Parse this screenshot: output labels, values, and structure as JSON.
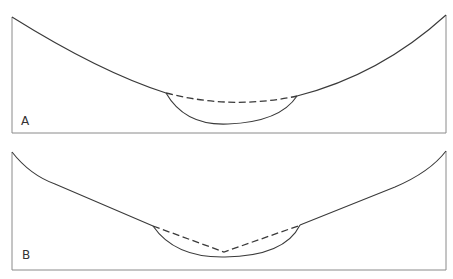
{
  "panels": [
    {
      "id": "A",
      "label": "A",
      "description": "Valley profile with rounded inner channel; dashed line shows former curved profile"
    },
    {
      "id": "B",
      "label": "B",
      "description": "Valley profile with rounded inner channel; dashed line shows former V-shaped profile"
    }
  ],
  "colors": {
    "line": "#3a3a3a",
    "frame": "#8a8a8a",
    "background": "#ffffff"
  }
}
